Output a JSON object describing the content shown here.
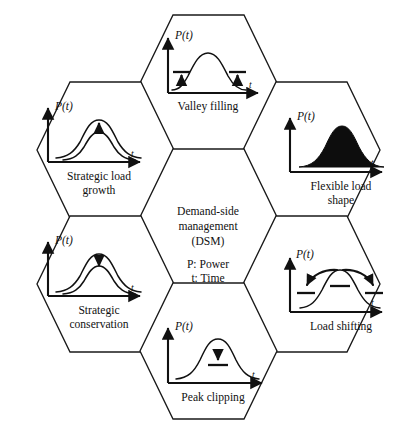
{
  "diagram": {
    "type": "hexagonal concept diagram",
    "stroke_color": "#1a1a1a",
    "fill_color": "#ffffff",
    "curve_fill_color": "#0d0d0d"
  },
  "center": {
    "line1": "Demand-side",
    "line2": "management",
    "line3": "(DSM)",
    "legend_power": "P: Power",
    "legend_time": "t: Time"
  },
  "axis": {
    "y_label": "P(t)",
    "x_label": "t"
  },
  "cells": [
    {
      "id": "valley-filling",
      "label_line1": "Valley filling",
      "label_line2": "",
      "y_label": "P(t)",
      "x_label": "t",
      "annotation": "two up-arrows with bars at the valleys on both sides of a central peak",
      "curve_style": "single peak with valleys",
      "position": "top"
    },
    {
      "id": "strategic-load-growth",
      "label_line1": "Strategic load",
      "label_line2": "growth",
      "y_label": "P(t)",
      "x_label": "t",
      "annotation": "up-arrow between a lower and a higher bell curve",
      "curve_style": "two stacked bell curves",
      "position": "upper-left"
    },
    {
      "id": "flexible-load-shape",
      "label_line1": "Flexible load",
      "label_line2": "shape",
      "y_label": "P(t)",
      "x_label": "t",
      "annotation": "solid filled bell curve",
      "curve_style": "filled bell curve",
      "position": "upper-right"
    },
    {
      "id": "strategic-conservation",
      "label_line1": "Strategic",
      "label_line2": "conservation",
      "y_label": "P(t)",
      "x_label": "t",
      "annotation": "down-arrow between a higher and a lower bell curve",
      "curve_style": "two stacked bell curves",
      "position": "lower-left"
    },
    {
      "id": "load-shifting",
      "label_line1": "Load shifting",
      "label_line2": "",
      "y_label": "P(t)",
      "x_label": "t",
      "annotation": "two curved arrows from the peak outward to bars on each side, plus a bar under the peak",
      "curve_style": "bell curve with shifted sides",
      "position": "lower-right"
    },
    {
      "id": "peak-clipping",
      "label_line1": "Peak clipping",
      "label_line2": "",
      "y_label": "P(t)",
      "x_label": "t",
      "annotation": "down-arrow onto a bar below the peak",
      "curve_style": "single bell curve",
      "position": "bottom"
    }
  ]
}
